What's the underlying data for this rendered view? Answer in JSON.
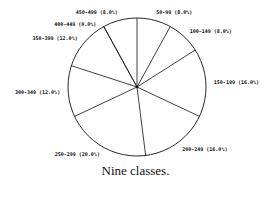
{
  "chart_data": {
    "type": "pie",
    "title": "",
    "caption": "Nine classes.",
    "start_angle_deg": 0,
    "direction": "clockwise",
    "categories": [
      "50-99",
      "100-149",
      "150-199",
      "200-249",
      "250-299",
      "300-349",
      "350-399",
      "400-449",
      "450-499"
    ],
    "values": [
      8.0,
      8.0,
      16.0,
      16.0,
      20.0,
      12.0,
      12.0,
      0.0,
      8.0
    ],
    "labels": [
      "50-99 (8.0%)",
      "100-149 (8.0%)",
      "150-199 (16.0%)",
      "200-249 (16.0%)",
      "250-299 (20.0%)",
      "300-349 (12.0%)",
      "350-399 (12.0%)",
      "400-449 (0.0%)",
      "450-499 (8.0%)"
    ],
    "unit": "%"
  },
  "caption": "Nine classes.",
  "colors": {
    "stroke": "#111111",
    "fill": "#ffffff"
  }
}
